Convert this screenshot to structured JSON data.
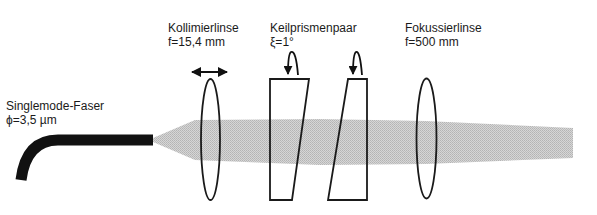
{
  "diagram": {
    "type": "optical-setup",
    "colors": {
      "beam": "#c8c8c8",
      "fiber": "#111111",
      "outline": "#1a1a1a"
    },
    "components": [
      {
        "id": "fiber",
        "name": "Singlemode-Faser",
        "param": "ϕ=3,5 µm",
        "icon": "optical-fiber"
      },
      {
        "id": "collimator",
        "name": "Kollimierlinse",
        "param": "f=15,4 mm",
        "icon": "lens",
        "motion": "translation-double-arrow"
      },
      {
        "id": "wedge-pair",
        "name": "Keilprismenpaar",
        "param": "ξ=1°",
        "icon": "wedge-prism",
        "count": 2,
        "motion": "rotation-arrow"
      },
      {
        "id": "focus",
        "name": "Fokussierlinse",
        "param": "f=500 mm",
        "icon": "lens"
      }
    ],
    "beam": {
      "label": "laser-beam",
      "direction": "left-to-right"
    }
  }
}
